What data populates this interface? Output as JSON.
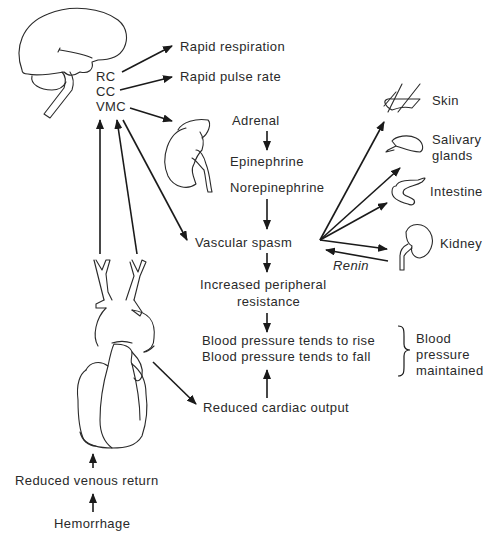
{
  "brain": {
    "centers": [
      "RC",
      "CC",
      "VMC"
    ]
  },
  "effects": {
    "rapid_respiration": "Rapid respiration",
    "rapid_pulse": "Rapid pulse rate"
  },
  "adrenal_chain": {
    "adrenal": "Adrenal",
    "epinephrine": "Epinephrine",
    "norepinephrine": "Norepinephrine"
  },
  "main_chain": {
    "vascular_spasm": "Vascular spasm",
    "increased_resistance_line1": "Increased peripheral",
    "increased_resistance_line2": "resistance",
    "bp_rise": "Blood pressure tends to rise",
    "bp_fall": "Blood pressure tends to fall",
    "reduced_cardiac_output": "Reduced cardiac output",
    "reduced_venous_return": "Reduced venous return",
    "hemorrhage": "Hemorrhage"
  },
  "targets": {
    "skin": "Skin",
    "salivary_line1": "Salivary",
    "salivary_line2": "glands",
    "intestine": "Intestine",
    "kidney": "Kidney",
    "renin": "Renin"
  },
  "outcome": {
    "line1": "Blood",
    "line2": "pressure",
    "line3": "maintained"
  },
  "colors": {
    "line": "#1a1a1a",
    "text": "#2a2a2a",
    "background": "#ffffff"
  }
}
